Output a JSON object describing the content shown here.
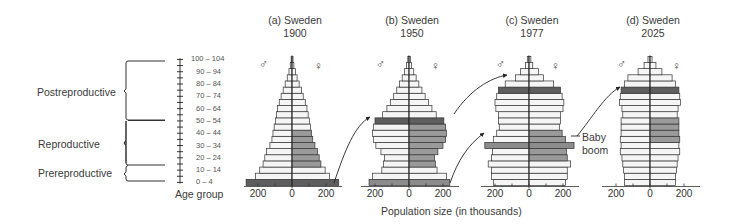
{
  "chart_data": {
    "type": "population-pyramid",
    "xlabel": "Population size (in thousands)",
    "ylabel": "Age group",
    "age_groups": [
      "0-4",
      "5-9",
      "10-14",
      "15-19",
      "20-24",
      "25-29",
      "30-34",
      "35-39",
      "40-44",
      "45-49",
      "50-54",
      "55-59",
      "60-64",
      "65-69",
      "70-74",
      "75-79",
      "80-84",
      "85-89",
      "90-94",
      "95-99",
      "100-104"
    ],
    "age_tick_labels": [
      "100 – 104",
      "90 – 94",
      "80 – 84",
      "70 – 74",
      "60 – 64",
      "50 – 54",
      "40 – 44",
      "30 – 34",
      "20 – 24",
      "10 – 14",
      "0 – 4"
    ],
    "x_ticks": [
      "200",
      "0",
      "200"
    ],
    "life_stages": [
      {
        "label": "Postreproductive",
        "from": "45-49",
        "to": "100-104"
      },
      {
        "label": "Reproductive",
        "from": "15-19",
        "to": "40-44"
      },
      {
        "label": "Prereproductive",
        "from": "0-4",
        "to": "10-14"
      }
    ],
    "male_symbol": "♂",
    "female_symbol": "♀",
    "annotation": "Baby boom",
    "cohort_tracking": "Arrows track the 1900 birth cohort (0-4) to ages 50-54 in 1950 and 75-79 in 1977; the 1950 baby-boom cohort is tracked to 25-29 in 1977 and 75-79 in 2025",
    "series": [
      {
        "panel": "a",
        "title_line1": "(a) Sweden",
        "title_line2": "1900",
        "center_x": 292,
        "male": [
          270,
          215,
          190,
          170,
          160,
          150,
          130,
          118,
          112,
          105,
          98,
          92,
          85,
          75,
          64,
          52,
          40,
          28,
          18,
          10,
          5
        ],
        "female": [
          275,
          220,
          195,
          170,
          160,
          150,
          135,
          122,
          115,
          108,
          102,
          95,
          88,
          78,
          66,
          55,
          42,
          30,
          20,
          11,
          6
        ],
        "dark_rows": [
          0
        ],
        "shaded_female_rows": [
          3,
          4,
          5,
          6,
          7,
          8
        ],
        "shaded_male_rows": []
      },
      {
        "panel": "b",
        "title_line1": "(b) Sweden",
        "title_line2": "1950",
        "center_x": 409,
        "male": [
          235,
          215,
          160,
          150,
          145,
          165,
          195,
          210,
          215,
          210,
          200,
          155,
          130,
          110,
          90,
          72,
          56,
          40,
          26,
          14,
          7
        ],
        "female": [
          240,
          220,
          165,
          155,
          150,
          170,
          200,
          215,
          220,
          215,
          205,
          160,
          135,
          115,
          95,
          76,
          58,
          42,
          28,
          15,
          8
        ],
        "dark_rows": [
          10
        ],
        "medium_rows": [
          0
        ],
        "shaded_female_rows": [
          3,
          4,
          5,
          6,
          7,
          8,
          9
        ],
        "shaded_male_rows": []
      },
      {
        "panel": "c",
        "title_line1": "(c) Sweden",
        "title_line2": "1977",
        "center_x": 529,
        "male": [
          210,
          220,
          220,
          240,
          220,
          215,
          260,
          210,
          190,
          175,
          180,
          180,
          195,
          200,
          190,
          180,
          140,
          80,
          50,
          20,
          10
        ],
        "female": [
          215,
          225,
          225,
          245,
          225,
          220,
          265,
          215,
          195,
          180,
          185,
          185,
          200,
          205,
          195,
          185,
          145,
          85,
          55,
          22,
          11
        ],
        "dark_rows": [
          15
        ],
        "medium_rows": [
          6
        ],
        "shaded_female_rows": [
          4,
          5,
          7,
          8
        ],
        "shaded_male_rows": []
      },
      {
        "panel": "d",
        "title_line1": "(d) Sweden",
        "title_line2": "2025",
        "center_x": 650,
        "male": [
          150,
          150,
          155,
          160,
          165,
          175,
          170,
          175,
          170,
          170,
          170,
          160,
          165,
          180,
          175,
          170,
          150,
          130,
          70,
          35,
          12
        ],
        "female": [
          150,
          150,
          155,
          160,
          165,
          175,
          170,
          175,
          170,
          170,
          170,
          160,
          165,
          180,
          175,
          170,
          150,
          130,
          70,
          35,
          12
        ],
        "dark_rows": [
          15
        ],
        "medium_rows": [],
        "shaded_female_rows": [
          7,
          8,
          9,
          10
        ],
        "shaded_male_rows": []
      }
    ],
    "colors": {
      "bar_fill": "#f5f5f5",
      "bar_stroke": "#333333",
      "shaded": "#9a9a9a",
      "medium": "#8c8c8c",
      "dark": "#5e5e5e"
    }
  },
  "labels": {
    "postreproductive": "Postreproductive",
    "reproductive": "Reproductive",
    "prereproductive": "Prereproductive",
    "age_group": "Age group",
    "population_size": "Population size (in thousands)",
    "baby_boom_line1": "Baby",
    "baby_boom_line2": "boom"
  }
}
